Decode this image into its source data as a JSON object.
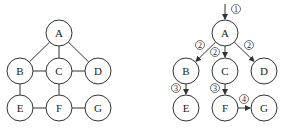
{
  "left_graph": {
    "name": "undirected-graph",
    "nodes": [
      {
        "id": "A",
        "x": 59,
        "y": 33
      },
      {
        "id": "B",
        "x": 20,
        "y": 71
      },
      {
        "id": "C",
        "x": 59,
        "y": 71
      },
      {
        "id": "D",
        "x": 98,
        "y": 71
      },
      {
        "id": "E",
        "x": 20,
        "y": 108
      },
      {
        "id": "F",
        "x": 59,
        "y": 108
      },
      {
        "id": "G",
        "x": 98,
        "y": 108
      }
    ],
    "edges": [
      [
        "A",
        "B"
      ],
      [
        "A",
        "C"
      ],
      [
        "A",
        "D"
      ],
      [
        "B",
        "C"
      ],
      [
        "C",
        "D"
      ],
      [
        "B",
        "E"
      ],
      [
        "C",
        "F"
      ],
      [
        "E",
        "F"
      ],
      [
        "F",
        "G"
      ]
    ]
  },
  "right_graph": {
    "name": "bfs-traversal",
    "nodes": [
      {
        "id": "A",
        "x": 225,
        "y": 33
      },
      {
        "id": "B",
        "x": 186,
        "y": 71
      },
      {
        "id": "C",
        "x": 225,
        "y": 71
      },
      {
        "id": "D",
        "x": 264,
        "y": 71
      },
      {
        "id": "E",
        "x": 186,
        "y": 108
      },
      {
        "id": "F",
        "x": 225,
        "y": 108
      },
      {
        "id": "G",
        "x": 264,
        "y": 108
      }
    ],
    "edges": [
      [
        "A",
        "B"
      ],
      [
        "A",
        "C"
      ],
      [
        "A",
        "D"
      ],
      [
        "B",
        "E"
      ],
      [
        "C",
        "F"
      ],
      [
        "F",
        "G"
      ]
    ],
    "start_arrow": {
      "label": "①",
      "x": 225,
      "y": 4
    },
    "step_labels": [
      {
        "label": "①",
        "x": 236,
        "y": 9
      },
      {
        "label": "②",
        "x": 200,
        "y": 45
      },
      {
        "label": "②",
        "x": 215,
        "y": 52
      },
      {
        "label": "②",
        "x": 249,
        "y": 45
      },
      {
        "label": "③",
        "x": 176,
        "y": 88
      },
      {
        "label": "③",
        "x": 215,
        "y": 88
      },
      {
        "label": "④",
        "x": 244,
        "y": 99
      }
    ]
  },
  "colors": {
    "stroke": "#333333",
    "text": "#222222",
    "background": "#ffffff"
  }
}
